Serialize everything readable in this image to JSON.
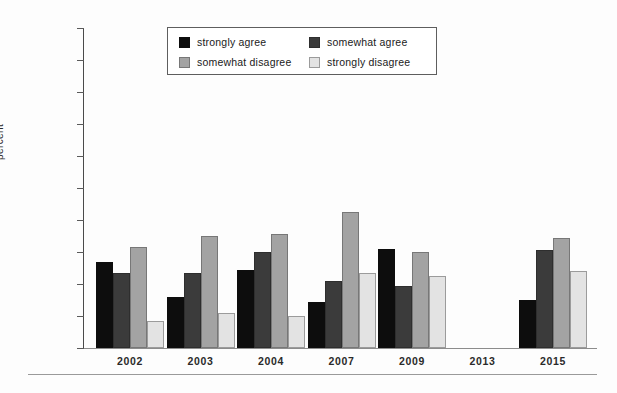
{
  "chart_data": {
    "type": "bar",
    "title": "",
    "xlabel": "",
    "ylabel": "percent",
    "ylim": [
      0,
      100
    ],
    "yticks": [
      0,
      10,
      20,
      30,
      40,
      50,
      60,
      70,
      80,
      90,
      100
    ],
    "ytick_labels": [
      "0",
      "10",
      "20",
      "30",
      "40",
      "50",
      "60",
      "70",
      "80",
      "90",
      "100"
    ],
    "grid": false,
    "legend_position": "top-center",
    "categories": [
      "2002",
      "2003",
      "2004",
      "2007",
      "2009",
      "2013",
      "2015"
    ],
    "series": [
      {
        "name": "strongly agree",
        "color": "#0d0d0d",
        "values": [
          27,
          16,
          24.5,
          14.5,
          31,
          null,
          15
        ]
      },
      {
        "name": "somewhat agree",
        "color": "#3b3b3b",
        "values": [
          23.5,
          23.5,
          30,
          21,
          19.5,
          null,
          30.5
        ]
      },
      {
        "name": "somewhat disagree",
        "color": "#a3a3a3",
        "values": [
          31.5,
          35,
          35.5,
          42.5,
          30,
          null,
          34.5
        ]
      },
      {
        "name": "strongly disagree",
        "color": "#e3e3e3",
        "values": [
          8.5,
          11,
          10,
          23.5,
          22.5,
          null,
          24
        ]
      }
    ]
  },
  "legend": {
    "items": [
      {
        "label": "strongly agree"
      },
      {
        "label": "somewhat agree"
      },
      {
        "label": "somewhat disagree"
      },
      {
        "label": "strongly disagree"
      }
    ]
  }
}
